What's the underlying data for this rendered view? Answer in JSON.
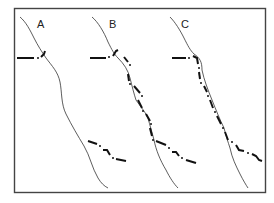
{
  "figure": {
    "panels": [
      {
        "id": "A",
        "label": "A"
      },
      {
        "id": "B",
        "label": "B"
      },
      {
        "id": "C",
        "label": "C"
      }
    ],
    "colors": {
      "frame": "#444444",
      "thin_line": "#333333",
      "thick_line": "#111111",
      "background": "#ffffff"
    }
  }
}
